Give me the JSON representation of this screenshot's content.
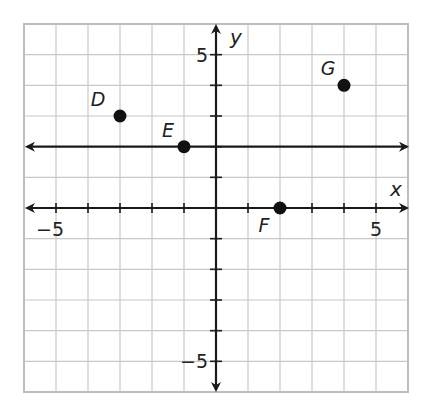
{
  "chart_data": {
    "type": "scatter",
    "title": "",
    "xlabel": "x",
    "ylabel": "y",
    "xlim": [
      -6,
      6
    ],
    "ylim": [
      -6,
      6
    ],
    "grid": true,
    "grid_step": 1,
    "x_tick_labels": [
      {
        "value": -5,
        "label": "−5"
      },
      {
        "value": 5,
        "label": "5"
      }
    ],
    "y_tick_labels": [
      {
        "value": 5,
        "label": "5"
      },
      {
        "value": -5,
        "label": "−5"
      }
    ],
    "points": [
      {
        "label": "D",
        "x": -3,
        "y": 3
      },
      {
        "label": "E",
        "x": -1,
        "y": 2
      },
      {
        "label": "F",
        "x": 2,
        "y": 0
      },
      {
        "label": "G",
        "x": 4,
        "y": 4
      }
    ],
    "lines": [
      {
        "type": "horizontal",
        "y": 2,
        "description": "line through E parallel to x-axis, arrows both ends"
      }
    ]
  },
  "colors": {
    "grid": "#c8c8c8",
    "border": "#bdbdbd",
    "axis": "#1a1a1a",
    "point": "#111111"
  }
}
